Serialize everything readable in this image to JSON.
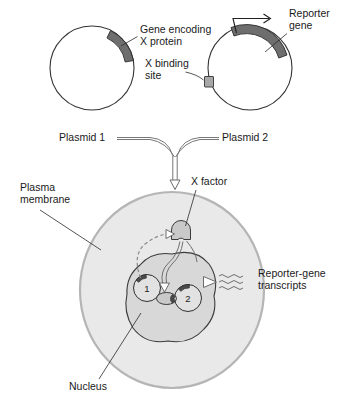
{
  "figure": {
    "background_color": "#ffffff"
  },
  "colors": {
    "gene_arc": "#6e6e6e",
    "binding_site": "#a8a8a8",
    "cell_fill": "#e9e9e9",
    "cell_border": "#b5b5b5",
    "nucleus_fill": "#d8d8d8",
    "nucleus_border": "#3a3a3a",
    "x_factor_fill": "#c9c9c9",
    "text": "#1a1a1a",
    "arrow": "#777777"
  },
  "labels": {
    "gene_encoding_line1": "Gene encoding",
    "gene_encoding_line2": "X protein",
    "x_binding_line1": "X binding",
    "x_binding_line2": "site",
    "reporter_gene_line1": "Reporter",
    "reporter_gene_line2": "gene",
    "plasmid_1": "Plasmid 1",
    "plasmid_2": "Plasmid 2",
    "plasma_membrane_line1": "Plasma",
    "plasma_membrane_line2": "membrane",
    "x_factor": "X factor",
    "reporter_transcripts_line1": "Reporter-gene",
    "reporter_transcripts_line2": "transcripts",
    "nucleus": "Nucleus",
    "inner_plasmid_1_number": "1",
    "inner_plasmid_2_number": "2"
  },
  "elements": {
    "plasmid_1": {
      "name": "Plasmid 1",
      "feature": "Gene encoding X protein",
      "feature_position": "upper-right arc"
    },
    "plasmid_2": {
      "name": "Plasmid 2",
      "features": [
        "Reporter gene",
        "X binding site"
      ],
      "reporter_position": "top arc",
      "binding_site_position": "left edge"
    },
    "cell": {
      "compartments": [
        "Plasma membrane",
        "Nucleus"
      ],
      "contents": [
        "X factor",
        "Plasmid 1",
        "Plasmid 2",
        "Reporter-gene transcripts"
      ]
    }
  }
}
